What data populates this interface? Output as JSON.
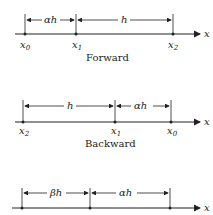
{
  "diagrams": [
    {
      "caption": "Forward",
      "points": [
        {
          "label": "x",
          "sub": "0"
        },
        {
          "label": "x",
          "sub": "1"
        },
        {
          "label": "x",
          "sub": "2"
        }
      ],
      "intervals": [
        "αh",
        "h"
      ],
      "axis_label": "x"
    },
    {
      "caption": "Backward",
      "points": [
        {
          "label": "x",
          "sub": "2"
        },
        {
          "label": "x",
          "sub": "1"
        },
        {
          "label": "x",
          "sub": "0"
        }
      ],
      "intervals": [
        "h",
        "αh"
      ],
      "axis_label": "x"
    },
    {
      "caption": "",
      "intervals": [
        "βh",
        "αh"
      ],
      "axis_label": "x"
    }
  ]
}
